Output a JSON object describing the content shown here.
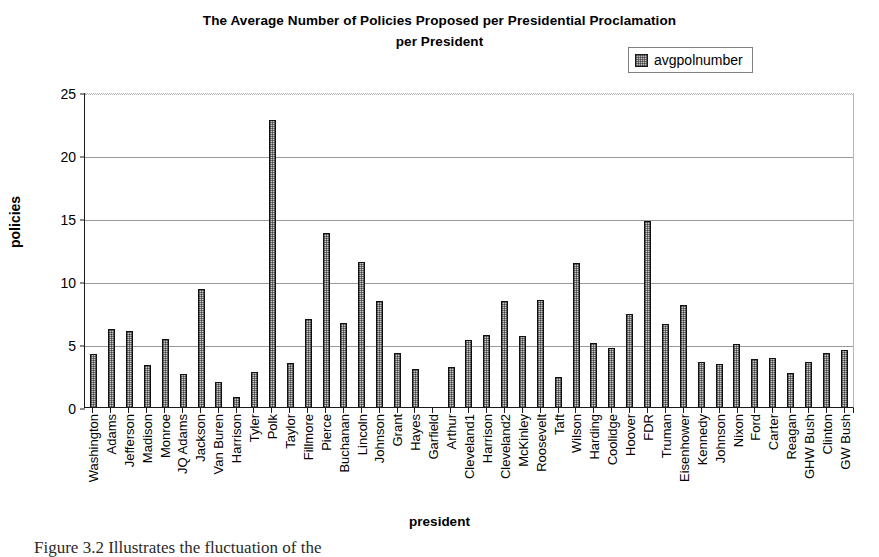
{
  "chart_data": {
    "type": "bar",
    "title": "The Average Number of Policies Proposed per Presidential Proclamation per President",
    "title_line1": "The Average Number of Policies Proposed per Presidential Proclamation",
    "title_line2": "per President",
    "xlabel": "president",
    "ylabel": "policies",
    "ylim": [
      0,
      25
    ],
    "yticks": [
      0,
      5,
      10,
      15,
      20,
      25
    ],
    "grid": true,
    "legend_position": "top-right",
    "series": [
      {
        "name": "avgpolnumber",
        "values": [
          4.2,
          6.2,
          6.0,
          3.3,
          5.4,
          2.6,
          9.4,
          2.0,
          0.8,
          2.8,
          22.8,
          3.5,
          7.0,
          13.8,
          6.7,
          11.5,
          8.4,
          4.3,
          3.0,
          0.0,
          3.2,
          5.3,
          5.7,
          8.4,
          5.6,
          8.5,
          2.4,
          11.4,
          5.1,
          4.7,
          7.4,
          14.8,
          6.6,
          8.1,
          3.6,
          3.4,
          5.0,
          3.8,
          3.9,
          2.7,
          3.6,
          4.3,
          4.5
        ]
      }
    ],
    "categories": [
      "Washington",
      "Adams",
      "Jefferson",
      "Madison",
      "Monroe",
      "JQ Adams",
      "Jackson",
      "Van Buren",
      "Harrison",
      "Tyler",
      "Polk",
      "Taylor",
      "Fillmore",
      "Pierce",
      "Buchanan",
      "Lincoln",
      "Johnson",
      "Grant",
      "Hayes",
      "Garfield",
      "Arthur",
      "Cleveland1",
      "Harrison",
      "Cleveland2",
      "McKinley",
      "Roosevelt",
      "Taft",
      "Wilson",
      "Harding",
      "Coolidge",
      "Hoover",
      "FDR",
      "Truman",
      "Eisenhower",
      "Kennedy",
      "Johnson",
      "Nixon",
      "Ford",
      "Carter",
      "Reagan",
      "GHW Bush",
      "Clinton",
      "GW Bush"
    ]
  },
  "legend": {
    "label": "avgpolnumber",
    "swatch_color": "#c0c0c0"
  },
  "caption": {
    "fragment": "Figure 3.2 Illustrates the fluctuation of the"
  },
  "colors": {
    "bar_fill": "#c9c9c9",
    "bar_border": "#111111",
    "gridline": "#9a9a9a",
    "axis": "#1a1a1a",
    "background": "#ffffff"
  }
}
